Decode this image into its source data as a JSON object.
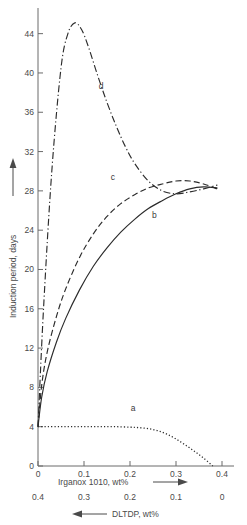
{
  "chart_data": {
    "type": "line",
    "title": "",
    "xlabel": "Irganox 1010, wt%",
    "xlabel_secondary": "DLTDP, wt%",
    "ylabel": "Induction period, days",
    "xlim": [
      0,
      0.4
    ],
    "ylim": [
      0,
      46
    ],
    "grid": false,
    "legend": "inline-curve-labels",
    "xticks": [
      "0",
      "0.1",
      "0.2",
      "0.3",
      "0.4"
    ],
    "xtick_values": [
      0,
      0.1,
      0.2,
      0.3,
      0.4
    ],
    "xticks_secondary": [
      "0.4",
      "0.3",
      "0.2",
      "0.1",
      "0"
    ],
    "xtick_secondary_values": [
      0.4,
      0.3,
      0.2,
      0.1,
      0
    ],
    "yticks": [
      "0",
      "4",
      "8",
      "12",
      "16",
      "20",
      "24",
      "28",
      "32",
      "36",
      "40",
      "44"
    ],
    "ytick_values": [
      0,
      4,
      8,
      12,
      16,
      20,
      24,
      28,
      32,
      36,
      40,
      44
    ],
    "series": [
      {
        "name": "a",
        "label": "a",
        "style": "dotted",
        "label_x": 0.207,
        "label_y": 5.6,
        "x": [
          0,
          0.02,
          0.05,
          0.08,
          0.11,
          0.14,
          0.17,
          0.2,
          0.22,
          0.24,
          0.26,
          0.28,
          0.3,
          0.32,
          0.34,
          0.36,
          0.38
        ],
        "y": [
          4.0,
          4.0,
          4.0,
          4.0,
          4.0,
          4.0,
          4.0,
          3.95,
          3.9,
          3.8,
          3.6,
          3.25,
          2.75,
          2.15,
          1.5,
          0.8,
          0.0
        ]
      },
      {
        "name": "b",
        "label": "b",
        "style": "solid",
        "label_x": 0.253,
        "label_y": 25.2,
        "x": [
          0,
          0.008,
          0.02,
          0.04,
          0.06,
          0.09,
          0.12,
          0.15,
          0.18,
          0.21,
          0.24,
          0.27,
          0.3,
          0.33,
          0.36,
          0.39
        ],
        "y": [
          4.0,
          7.0,
          9.6,
          12.6,
          15.0,
          17.9,
          20.3,
          22.2,
          23.8,
          25.1,
          26.2,
          27.0,
          27.7,
          28.2,
          28.4,
          28.3
        ]
      },
      {
        "name": "c",
        "label": "c",
        "style": "dashed",
        "label_x": 0.163,
        "label_y": 29.1,
        "x": [
          0,
          0.008,
          0.02,
          0.04,
          0.06,
          0.09,
          0.12,
          0.15,
          0.18,
          0.21,
          0.24,
          0.27,
          0.3,
          0.33,
          0.36,
          0.39
        ],
        "y": [
          4.0,
          8.2,
          11.6,
          15.2,
          18.0,
          21.2,
          23.6,
          25.4,
          26.7,
          27.6,
          28.3,
          28.7,
          29.0,
          29.0,
          28.7,
          28.2
        ]
      },
      {
        "name": "d",
        "label": "d",
        "style": "dash-dot",
        "label_x": 0.137,
        "label_y": 38.4,
        "x": [
          0,
          0.012,
          0.03,
          0.05,
          0.065,
          0.08,
          0.095,
          0.11,
          0.13,
          0.15,
          0.17,
          0.19,
          0.21,
          0.24,
          0.27,
          0.3,
          0.33,
          0.36,
          0.39
        ],
        "y": [
          4.0,
          16.0,
          30.0,
          40.5,
          44.0,
          45.1,
          44.4,
          42.6,
          39.7,
          37.0,
          34.6,
          32.5,
          30.8,
          29.0,
          28.0,
          27.7,
          27.9,
          28.2,
          28.6
        ]
      }
    ]
  },
  "axes": {
    "y_arrow": "up-arrow",
    "x_arrow_primary": "right-arrow",
    "x_arrow_secondary": "left-arrow"
  },
  "colors": {
    "background": "#ffffff",
    "axis": "#6b6b6b",
    "curve": "#2b2b2b",
    "text": "#4a4a4a"
  }
}
